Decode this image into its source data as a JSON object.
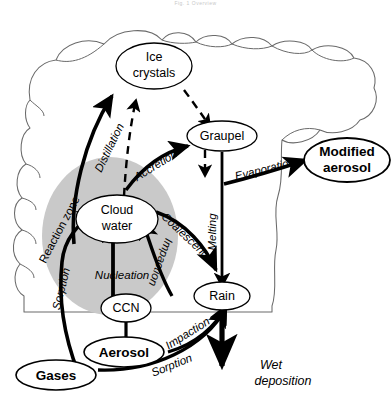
{
  "page": {
    "header_text": "Fig. 1   Overview",
    "background_color": "#ffffff"
  },
  "figure": {
    "cloud_outline_color": "#555555",
    "reaction_zone_fill": "#c9c9c9",
    "arrow_color": "#000000"
  },
  "nodes": {
    "ice_crystals": {
      "line1": "Ice",
      "line2": "crystals"
    },
    "graupel": {
      "label": "Graupel"
    },
    "cloud_water": {
      "line1": "Cloud",
      "line2": "water"
    },
    "rain": {
      "label": "Rain"
    },
    "ccn": {
      "label": "CCN"
    },
    "aerosol": {
      "label": "Aerosol"
    },
    "gases": {
      "label": "Gases"
    },
    "modified_aerosol": {
      "line1": "Modified",
      "line2": "aerosol"
    }
  },
  "processes": {
    "distillation": "Distillation",
    "accretion": "Accretion",
    "evaporation": "Evaporation",
    "melting": "Melting",
    "coalescence": "Coalescence",
    "impaction_upper": "Impaction",
    "impaction_lower": "Impaction",
    "nucleation": "Nucleation",
    "sorption_upper": "Sorption",
    "sorption_lower": "Sorption"
  },
  "zones": {
    "reaction_zone": "Reaction zone"
  },
  "outputs": {
    "wet_deposition_line1": "Wet",
    "wet_deposition_line2": "deposition"
  }
}
